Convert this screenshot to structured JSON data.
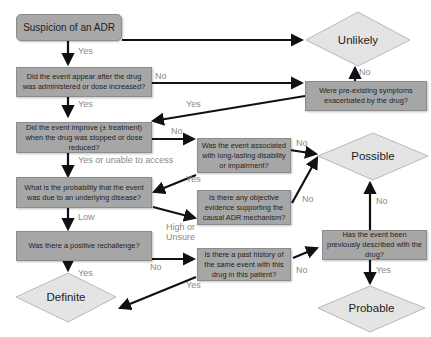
{
  "colors": {
    "box_fill": "#a6a6a6",
    "diamond_fill": "#e4e4e4",
    "arrow": "#111111",
    "label_text": "#8a8a8a"
  },
  "nodes": {
    "start": "Suspicion of an ADR",
    "q_temporal": "Did the event appear after the drug was administered or dose increased?",
    "q_preexisting": "Were pre-existing symptoms exacerbated by the drug?",
    "q_dechallenge": "Did the event improve (± treatment) when the drug was stopped or dose reduced?",
    "q_longlasting": "Was the event associated with long-lasting disability or impairment?",
    "q_underlying": "What is the probability that the event was due to an underlying disease?",
    "q_objective": "Is there any objective evidence supporting the causal ADR mechanism?",
    "q_rechallenge": "Was there a positive rechallenge?",
    "q_history": "Is there a past history of the same event with this drug in this patient?",
    "q_described": "Has the event been previously described with the drug?"
  },
  "outcomes": {
    "unlikely": "Unlikely",
    "possible": "Possible",
    "definite": "Definite",
    "probable": "Probable"
  },
  "edge_labels": {
    "start_yes": "Yes",
    "temporal_no": "No",
    "temporal_yes": "Yes",
    "preexisting_yes": "Yes",
    "preexisting_no": "No",
    "dechallenge_no": "No",
    "dechallenge_yes": "Yes or unable to access",
    "longlasting_yes": "Yes",
    "longlasting_no": "No",
    "underlying_low": "Low",
    "underlying_high": "High or Unsure",
    "objective_no": "No",
    "rechallenge_yes": "Yes",
    "rechallenge_no": "No",
    "history_yes": "Yes",
    "history_no": "No",
    "described_no": "No",
    "described_yes": "Yes"
  }
}
